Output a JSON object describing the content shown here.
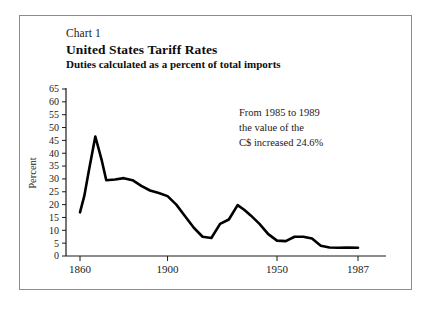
{
  "figure": {
    "chart_number_label": "Chart 1",
    "title": "United States Tariff Rates",
    "subtitle": "Duties calculated as a percent of total imports",
    "border_color": "#8c8c8c",
    "background_color": "#ffffff",
    "line_color": "#000000"
  },
  "annotation": {
    "line1": "From 1985 to 1989",
    "line2": "the value of the",
    "line3": "C$ increased 24.6%"
  },
  "chart_data": {
    "type": "line",
    "title": "United States Tariff Rates",
    "subtitle": "Duties calculated as a percent of total imports",
    "xlabel": "",
    "ylabel": "Percent",
    "xlim": [
      1855,
      1990
    ],
    "ylim": [
      0,
      65
    ],
    "grid": false,
    "legend": "none",
    "y_ticks": [
      0,
      5,
      10,
      15,
      20,
      25,
      30,
      35,
      40,
      45,
      50,
      55,
      60,
      65
    ],
    "y_tick_labels": [
      "0",
      "5",
      "10",
      "15",
      "20",
      "25",
      "30",
      "35",
      "40",
      "45",
      "50",
      "55",
      "60",
      "65"
    ],
    "x_ticks": [
      1860,
      1900,
      1950,
      1987
    ],
    "x_tick_labels": [
      "1860",
      "1900",
      "1950",
      "1987"
    ],
    "series": [
      {
        "name": "US tariff rate",
        "x": [
          1860,
          1862,
          1864,
          1867,
          1870,
          1872,
          1876,
          1880,
          1884,
          1888,
          1892,
          1896,
          1900,
          1904,
          1908,
          1912,
          1916,
          1920,
          1924,
          1928,
          1932,
          1935,
          1938,
          1942,
          1946,
          1950,
          1954,
          1958,
          1962,
          1966,
          1970,
          1974,
          1978,
          1982,
          1987
        ],
        "values": [
          17.0,
          23.5,
          33.0,
          46.5,
          37.0,
          29.5,
          29.8,
          30.3,
          29.5,
          27.3,
          25.5,
          24.5,
          23.3,
          20.0,
          15.5,
          11.0,
          7.5,
          7.0,
          12.5,
          14.2,
          19.8,
          18.0,
          15.8,
          12.5,
          8.5,
          6.0,
          5.8,
          7.5,
          7.5,
          6.8,
          4.0,
          3.3,
          3.2,
          3.3,
          3.2
        ]
      }
    ]
  },
  "axes": {
    "y_axis_title": "Percent"
  }
}
